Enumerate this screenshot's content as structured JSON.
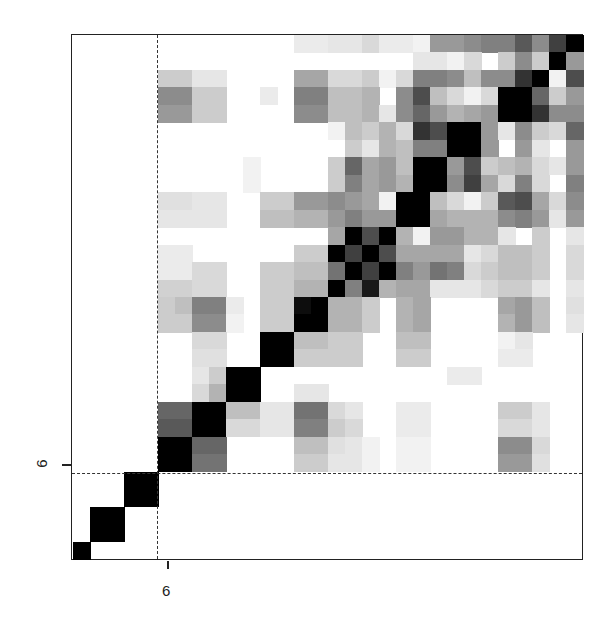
{
  "chart_data": {
    "type": "heatmap",
    "title": "",
    "xlabel": "",
    "ylabel": "",
    "grid_size": [
      30,
      30
    ],
    "orientation": "row 0 = top, diagonal runs bottom-left to top-right",
    "x_ticks": [
      {
        "position": 6,
        "label": "6"
      }
    ],
    "y_ticks": [
      {
        "position": 6,
        "label": "6"
      }
    ],
    "reference_lines": {
      "vertical_dashed_after_col": 5,
      "horizontal_dashed_after_row_from_bottom": 5
    },
    "color_scale": "white (0) to black (1)",
    "matrix": [
      [
        0,
        0,
        0,
        0,
        0,
        0,
        0,
        0,
        0,
        0,
        0,
        0,
        0,
        0.08,
        0.08,
        0.1,
        0.1,
        0.15,
        0.08,
        0.08,
        0.05,
        0.4,
        0.4,
        0.45,
        0.5,
        0.5,
        0.65,
        0.45,
        0.75,
        1
      ],
      [
        0,
        0,
        0,
        0,
        0,
        0,
        0,
        0,
        0,
        0,
        0,
        0,
        0,
        0,
        0,
        0,
        0,
        0,
        0,
        0,
        0.1,
        0.1,
        0.05,
        0.15,
        0,
        0.2,
        0.45,
        0.2,
        1,
        0.4
      ],
      [
        0,
        0,
        0,
        0,
        0,
        0.2,
        0.2,
        0.1,
        0.1,
        0,
        0,
        0,
        0,
        0.35,
        0.35,
        0.15,
        0.15,
        0.2,
        0.05,
        0.15,
        0.5,
        0.5,
        0.45,
        0.25,
        0.45,
        0.45,
        0.8,
        1,
        0.05,
        0.7
      ],
      [
        0,
        0,
        0,
        0,
        0,
        0.45,
        0.45,
        0.2,
        0.2,
        0,
        0,
        0.08,
        0,
        0.5,
        0.5,
        0.25,
        0.25,
        0.3,
        0,
        0.45,
        0.7,
        0.25,
        0.15,
        0.05,
        0.15,
        1,
        1,
        0.6,
        0.2,
        0.4
      ],
      [
        0,
        0,
        0,
        0,
        0,
        0.4,
        0.4,
        0.2,
        0.2,
        0,
        0,
        0,
        0,
        0.45,
        0.45,
        0.25,
        0.25,
        0.3,
        0.1,
        0.45,
        0.6,
        0.4,
        0.3,
        0.35,
        0.4,
        1,
        1,
        0.8,
        0.45,
        0.45
      ],
      [
        0,
        0,
        0,
        0,
        0,
        0,
        0,
        0,
        0,
        0,
        0,
        0,
        0,
        0,
        0,
        0.05,
        0.25,
        0.2,
        0.3,
        0.15,
        0.8,
        0.7,
        1,
        1,
        0.4,
        0.1,
        0.45,
        0.2,
        0.15,
        0.6
      ],
      [
        0,
        0,
        0,
        0,
        0,
        0,
        0,
        0,
        0,
        0,
        0,
        0,
        0,
        0,
        0,
        0,
        0.2,
        0.1,
        0.3,
        0.25,
        0.5,
        0.5,
        1,
        1,
        0.4,
        0,
        0.4,
        0.1,
        0,
        0.4
      ],
      [
        0,
        0,
        0,
        0,
        0,
        0,
        0,
        0,
        0,
        0,
        0.05,
        0,
        0,
        0,
        0,
        0.2,
        0.6,
        0.35,
        0.4,
        0.25,
        1,
        1,
        0.4,
        0.7,
        0.2,
        0.25,
        0.3,
        0.15,
        0.1,
        0.4
      ],
      [
        0,
        0,
        0,
        0,
        0,
        0,
        0,
        0,
        0,
        0,
        0.05,
        0,
        0,
        0,
        0,
        0.2,
        0.5,
        0.35,
        0.4,
        0.3,
        1,
        1,
        0.45,
        0.75,
        0.35,
        0.15,
        0.5,
        0.15,
        0,
        0.5
      ],
      [
        0,
        0,
        0,
        0,
        0,
        0.12,
        0.12,
        0.1,
        0.1,
        0,
        0,
        0.2,
        0.2,
        0.4,
        0.4,
        0.45,
        0.4,
        0.35,
        0.05,
        1,
        1,
        0.25,
        0.15,
        0.05,
        0.2,
        0.65,
        0.7,
        0.35,
        0.15,
        0.45
      ],
      [
        0,
        0,
        0,
        0,
        0,
        0.1,
        0.1,
        0.1,
        0.1,
        0,
        0,
        0.25,
        0.25,
        0.3,
        0.3,
        0.4,
        0.5,
        0.4,
        0.4,
        1,
        1,
        0.35,
        0.3,
        0.3,
        0.3,
        0.45,
        0.5,
        0.4,
        0.1,
        0.4
      ],
      [
        0,
        0,
        0,
        0,
        0,
        0,
        0,
        0,
        0,
        0,
        0,
        0,
        0,
        0,
        0,
        0.35,
        1,
        0.7,
        1,
        0.3,
        0.05,
        0.4,
        0.4,
        0.3,
        0.3,
        0.1,
        0,
        0.2,
        0,
        0.1
      ],
      [
        0,
        0,
        0,
        0,
        0,
        0.08,
        0.08,
        0,
        0,
        0,
        0,
        0,
        0,
        0.2,
        0.2,
        1,
        0.75,
        1,
        0.7,
        0.35,
        0.35,
        0.35,
        0.35,
        0.1,
        0.15,
        0.25,
        0.25,
        0.2,
        0,
        0.15
      ],
      [
        0,
        0,
        0,
        0,
        0,
        0.08,
        0.08,
        0.15,
        0.15,
        0,
        0,
        0.2,
        0.2,
        0.25,
        0.25,
        0.55,
        1,
        0.75,
        1,
        0.5,
        0.4,
        0.55,
        0.5,
        0.15,
        0.2,
        0.25,
        0.25,
        0.2,
        0,
        0.15
      ],
      [
        0,
        0,
        0,
        0,
        0,
        0.18,
        0.18,
        0.15,
        0.15,
        0,
        0,
        0.2,
        0.2,
        0.3,
        0.3,
        1,
        0.5,
        0.9,
        0.3,
        0.35,
        0.35,
        0.1,
        0.1,
        0.1,
        0.15,
        0.2,
        0.2,
        0.1,
        0,
        0.1
      ],
      [
        0,
        0,
        0,
        0,
        0,
        0.2,
        0.25,
        0.5,
        0.5,
        0.08,
        0,
        0.2,
        0.2,
        0.95,
        1,
        0.3,
        0.3,
        0.2,
        0,
        0.3,
        0.35,
        0,
        0,
        0,
        0,
        0.35,
        0.4,
        0.25,
        0,
        0.12
      ],
      [
        0,
        0,
        0,
        0,
        0,
        0.2,
        0.2,
        0.45,
        0.45,
        0.05,
        0,
        0.2,
        0.2,
        1,
        1,
        0.3,
        0.3,
        0.2,
        0,
        0.3,
        0.35,
        0,
        0,
        0,
        0,
        0.3,
        0.4,
        0.25,
        0,
        0.1
      ],
      [
        0,
        0,
        0,
        0,
        0,
        0,
        0,
        0.15,
        0.15,
        0,
        0,
        1,
        1,
        0.25,
        0.25,
        0.2,
        0.2,
        0,
        0,
        0.25,
        0.25,
        0,
        0,
        0,
        0,
        0.05,
        0.1,
        0,
        0,
        0
      ],
      [
        0,
        0,
        0,
        0,
        0,
        0,
        0,
        0.12,
        0.12,
        0,
        0,
        1,
        1,
        0.2,
        0.2,
        0.2,
        0.2,
        0,
        0,
        0.2,
        0.2,
        0,
        0,
        0,
        0,
        0.08,
        0.08,
        0,
        0,
        0
      ],
      [
        0,
        0,
        0,
        0,
        0,
        0,
        0,
        0.1,
        0.2,
        1,
        1,
        0,
        0,
        0,
        0,
        0,
        0,
        0,
        0,
        0,
        0,
        0,
        0.08,
        0.08,
        0,
        0,
        0,
        0,
        0,
        0
      ],
      [
        0,
        0,
        0,
        0,
        0,
        0,
        0,
        0.15,
        0.3,
        1,
        1,
        0,
        0,
        0.1,
        0.1,
        0,
        0,
        0,
        0,
        0,
        0,
        0,
        0,
        0,
        0,
        0,
        0,
        0,
        0,
        0
      ],
      [
        0,
        0,
        0,
        0,
        0,
        0.6,
        0.6,
        1,
        1,
        0.25,
        0.25,
        0.1,
        0.1,
        0.55,
        0.55,
        0.15,
        0.1,
        0,
        0,
        0.08,
        0.08,
        0,
        0,
        0,
        0,
        0.2,
        0.2,
        0.1,
        0,
        0
      ],
      [
        0,
        0,
        0,
        0,
        0,
        0.65,
        0.65,
        1,
        1,
        0.15,
        0.15,
        0.1,
        0.1,
        0.5,
        0.5,
        0.2,
        0.15,
        0,
        0,
        0.08,
        0.08,
        0,
        0,
        0,
        0,
        0.15,
        0.15,
        0.1,
        0,
        0
      ],
      [
        0,
        0,
        0,
        0,
        0,
        1,
        1,
        0.6,
        0.6,
        0,
        0,
        0,
        0,
        0.25,
        0.25,
        0.12,
        0.1,
        0.05,
        0,
        0.05,
        0.05,
        0,
        0,
        0,
        0,
        0.45,
        0.45,
        0.15,
        0,
        0
      ],
      [
        0,
        0,
        0,
        0,
        0,
        1,
        1,
        0.55,
        0.55,
        0,
        0,
        0,
        0,
        0.2,
        0.2,
        0.1,
        0.1,
        0.05,
        0,
        0.05,
        0.05,
        0,
        0,
        0,
        0,
        0.4,
        0.4,
        0.12,
        0,
        0
      ],
      [
        0,
        0,
        0,
        1,
        1,
        0,
        0,
        0,
        0,
        0,
        0,
        0,
        0,
        0,
        0,
        0,
        0,
        0,
        0,
        0,
        0,
        0,
        0,
        0,
        0,
        0,
        0,
        0,
        0,
        0
      ],
      [
        0,
        0,
        0,
        1,
        1,
        0,
        0,
        0,
        0,
        0,
        0,
        0,
        0,
        0,
        0,
        0,
        0,
        0,
        0,
        0,
        0,
        0,
        0,
        0,
        0,
        0,
        0,
        0,
        0,
        0
      ],
      [
        0,
        1,
        1,
        0,
        0,
        0,
        0,
        0,
        0,
        0,
        0,
        0,
        0,
        0,
        0,
        0,
        0,
        0,
        0,
        0,
        0,
        0,
        0,
        0,
        0,
        0,
        0,
        0,
        0,
        0
      ],
      [
        0,
        1,
        1,
        0,
        0,
        0,
        0,
        0,
        0,
        0,
        0,
        0,
        0,
        0,
        0,
        0,
        0,
        0,
        0,
        0,
        0,
        0,
        0,
        0,
        0,
        0,
        0,
        0,
        0,
        0
      ],
      [
        1,
        0,
        0,
        0,
        0,
        0,
        0,
        0,
        0,
        0,
        0,
        0,
        0,
        0,
        0,
        0,
        0,
        0,
        0,
        0,
        0,
        0,
        0,
        0,
        0,
        0,
        0,
        0,
        0,
        0
      ]
    ]
  },
  "axes": {
    "x_tick_label": "6",
    "y_tick_label": "6"
  }
}
